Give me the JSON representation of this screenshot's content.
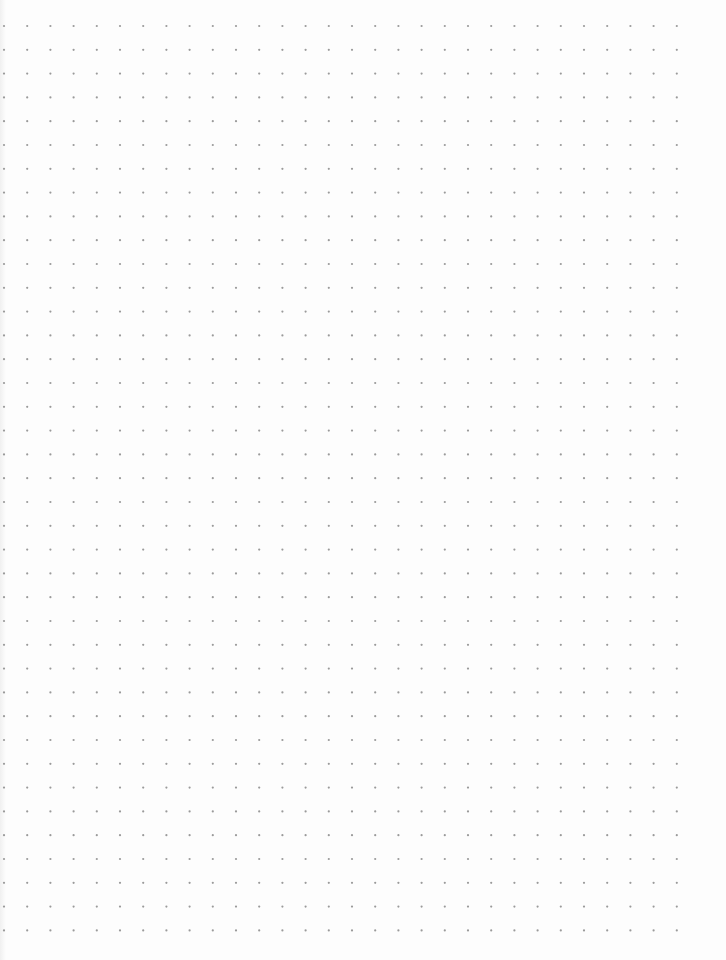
{
  "page": {
    "type": "dot-grid paper",
    "background": "#fdfdfd",
    "dot_color": "#9a9a9a",
    "dot_radius": 1.1,
    "grid": {
      "origin_x": 4,
      "origin_y": 26,
      "spacing_x": 23.2,
      "spacing_y": 23.8,
      "columns": 30,
      "rows": 39
    }
  }
}
